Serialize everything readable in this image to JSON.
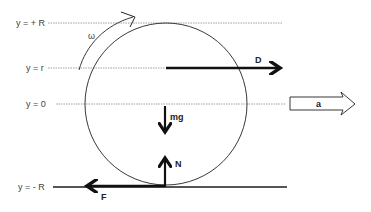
{
  "diagram": {
    "levels": [
      {
        "label": "y = + R",
        "y": 23
      },
      {
        "label": "y = r",
        "y": 68
      },
      {
        "label": "y = 0",
        "y": 104
      },
      {
        "label": "y = - R",
        "y": 187
      }
    ],
    "angular_velocity": {
      "label": "ω"
    },
    "forces": {
      "drive": {
        "label": "D"
      },
      "weight": {
        "label": "mg"
      },
      "normal": {
        "label": "N"
      },
      "friction": {
        "label": "F"
      }
    },
    "acceleration": {
      "label": "a"
    },
    "colors": {
      "line": "#222222",
      "dotted": "#888888",
      "ground": "#555555",
      "text": "#444444"
    }
  }
}
